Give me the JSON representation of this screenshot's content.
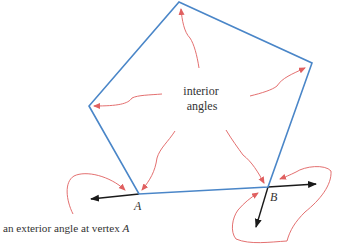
{
  "diagram": {
    "title_labels": {
      "interior_line1": "interior",
      "interior_line2": "angles",
      "vertex_a": "A",
      "vertex_b": "B",
      "caption_prefix": "an exterior angle at vertex ",
      "caption_vertex": "A"
    },
    "colors": {
      "polygon": "#4a86c8",
      "annotation_arrows": "#e06060",
      "extension_arrows": "#1a1a1a",
      "text": "#333333"
    },
    "polygon_vertices": [
      {
        "name": "top",
        "x": 179,
        "y": 2
      },
      {
        "name": "right",
        "x": 312,
        "y": 63
      },
      {
        "name": "B",
        "x": 268,
        "y": 187
      },
      {
        "name": "A",
        "x": 139,
        "y": 194
      },
      {
        "name": "left",
        "x": 89,
        "y": 106
      }
    ]
  }
}
